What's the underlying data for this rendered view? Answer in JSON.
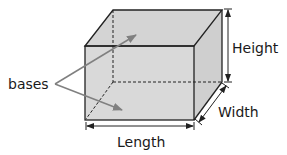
{
  "diagram": {
    "type": "rectangular-prism",
    "labels": {
      "height": "Height",
      "width": "Width",
      "length": "Length",
      "bases": "bases"
    },
    "colors": {
      "face_fill": "#d9d9d9",
      "edge": "#222222",
      "pointer": "#808080"
    }
  }
}
